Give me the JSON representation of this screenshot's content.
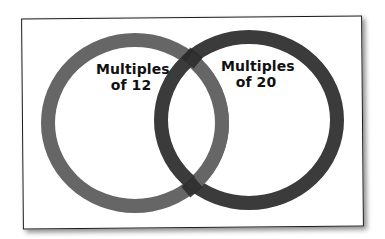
{
  "diagram": {
    "type": "venn",
    "sets": [
      {
        "id": "left",
        "label_line1": "Multiples",
        "label_line2": "of 12",
        "ring_color": "#666666"
      },
      {
        "id": "right",
        "label_line1": "Multiples",
        "label_line2": "of 20",
        "ring_color": "#3a3a3a"
      }
    ],
    "overlap_color": "#2a2a2a",
    "frame_color": "#1a1a1a",
    "background": "#ffffff"
  }
}
